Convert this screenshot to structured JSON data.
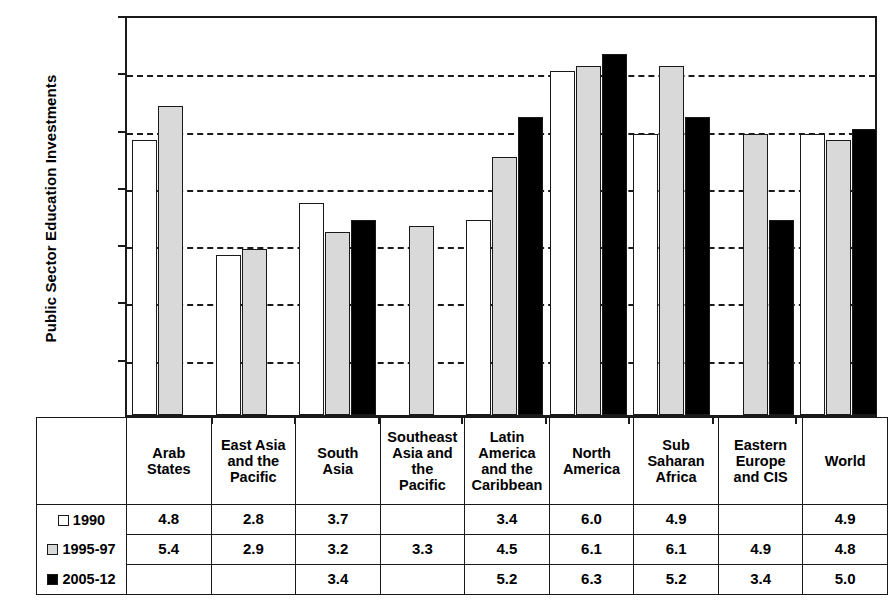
{
  "chart_data": {
    "type": "bar",
    "title": "",
    "ylabel": "Public Sector Education Investments",
    "xlabel": "",
    "ylim": [
      0.0,
      7.0
    ],
    "ytick_labels": [
      "7.0",
      "6.0",
      "5.0",
      "4.0",
      "3.0",
      "2.0",
      "1.0",
      "0.0"
    ],
    "ytick_values": [
      7.0,
      6.0,
      5.0,
      4.0,
      3.0,
      2.0,
      1.0,
      0.0
    ],
    "grid": "horizontal-dashed",
    "legend_position": "table-left-column",
    "categories": [
      "Arab States",
      "East Asia and the Pacific",
      "South Asia",
      "Southeast Asia and the Pacific",
      "Latin America and the Caribbean",
      "North America",
      "Sub Saharan Africa",
      "Eastern Europe and CIS",
      "World"
    ],
    "category_lines": [
      [
        "Arab",
        "States"
      ],
      [
        "East Asia",
        "and the",
        "Pacific"
      ],
      [
        "South",
        "Asia"
      ],
      [
        "Southeast",
        "Asia and",
        "the",
        "Pacific"
      ],
      [
        "Latin",
        "America",
        "and the",
        "Caribbean"
      ],
      [
        "North",
        "America"
      ],
      [
        "Sub",
        "Saharan",
        "Africa"
      ],
      [
        "Eastern",
        "Europe",
        "and CIS"
      ],
      [
        "World"
      ]
    ],
    "series": [
      {
        "name": "1990",
        "color": "#ffffff",
        "values": [
          4.8,
          2.8,
          3.7,
          null,
          3.4,
          6.0,
          4.9,
          null,
          4.9
        ],
        "labels": [
          "4.8",
          "2.8",
          "3.7",
          "",
          "3.4",
          "6.0",
          "4.9",
          "",
          "4.9"
        ]
      },
      {
        "name": "1995-97",
        "color": "#d9d9d9",
        "values": [
          5.4,
          2.9,
          3.2,
          3.3,
          4.5,
          6.1,
          6.1,
          4.9,
          4.8
        ],
        "labels": [
          "5.4",
          "2.9",
          "3.2",
          "3.3",
          "4.5",
          "6.1",
          "6.1",
          "4.9",
          "4.8"
        ]
      },
      {
        "name": "2005-12",
        "color": "#000000",
        "values": [
          null,
          null,
          3.4,
          null,
          5.2,
          6.3,
          5.2,
          3.4,
          5.0
        ],
        "labels": [
          "",
          "",
          "3.4",
          "",
          "5.2",
          "6.3",
          "5.2",
          "3.4",
          "5.0"
        ]
      }
    ]
  }
}
